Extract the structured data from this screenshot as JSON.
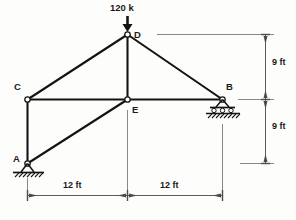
{
  "figure": {
    "background_color": "#fdfdfb",
    "line_color": "#1a1a1a",
    "dimension_color": "#555555"
  },
  "load": {
    "label": "120 k",
    "magnitude": 120,
    "unit": "k",
    "direction": "down",
    "applied_at": "D"
  },
  "joints": [
    {
      "id": "A",
      "label": "A",
      "x": 27,
      "y": 163,
      "support": "pin",
      "label_dx": -12,
      "label_dy": -10
    },
    {
      "id": "B",
      "label": "B",
      "x": 222,
      "y": 99,
      "support": "roller",
      "label_dx": 4,
      "label_dy": -18
    },
    {
      "id": "C",
      "label": "C",
      "x": 27,
      "y": 99,
      "support": "none",
      "label_dx": -13,
      "label_dy": -18
    },
    {
      "id": "D",
      "label": "D",
      "x": 127,
      "y": 34,
      "support": "none",
      "label_dx": 7,
      "label_dy": -5
    },
    {
      "id": "E",
      "label": "E",
      "x": 127,
      "y": 99,
      "support": "none",
      "label_dx": 5,
      "label_dy": 6
    }
  ],
  "members": [
    {
      "from": "C",
      "to": "D"
    },
    {
      "from": "D",
      "to": "B"
    },
    {
      "from": "C",
      "to": "E"
    },
    {
      "from": "E",
      "to": "B"
    },
    {
      "from": "D",
      "to": "E"
    },
    {
      "from": "A",
      "to": "C"
    },
    {
      "from": "A",
      "to": "E"
    }
  ],
  "dimensions": {
    "vertical": [
      {
        "label": "9 ft",
        "value": 9,
        "unit": "ft",
        "from_level": "D",
        "to_level": "B",
        "text_x": 272,
        "text_y": 62
      },
      {
        "label": "9 ft",
        "value": 9,
        "unit": "ft",
        "from_level": "B",
        "to_level": "A",
        "text_x": 272,
        "text_y": 126
      }
    ],
    "horizontal": [
      {
        "label": "12 ft",
        "value": 12,
        "unit": "ft",
        "from_joint": "A",
        "to_joint": "E",
        "text_x": 77,
        "text_y": 186
      },
      {
        "label": "12 ft",
        "value": 12,
        "unit": "ft",
        "from_joint": "E",
        "to_joint": "B",
        "text_x": 174,
        "text_y": 186
      }
    ]
  }
}
